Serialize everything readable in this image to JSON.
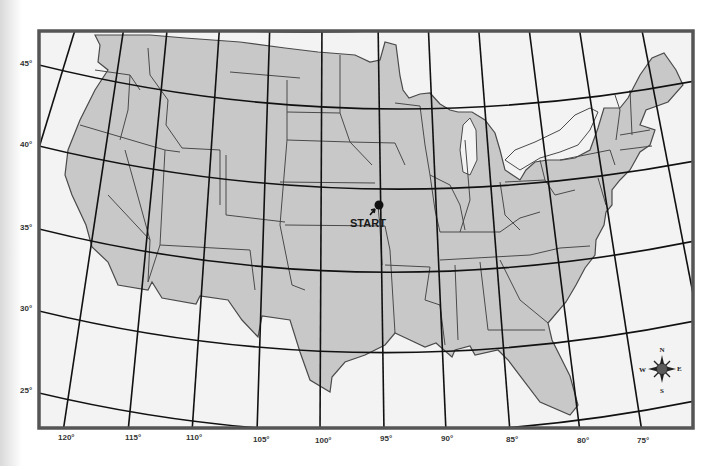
{
  "map": {
    "title": "",
    "colors": {
      "land": "#c8c8c8",
      "water": "#f3f3f3",
      "border": "#555555",
      "graticule": "#111111",
      "state_line": "#4a4a4a",
      "marker": "#111111",
      "compass": "#5a5a5a"
    },
    "latitude_labels": [
      {
        "label": "45°",
        "y": 63
      },
      {
        "label": "40°",
        "y": 144
      },
      {
        "label": "35°",
        "y": 227
      },
      {
        "label": "30°",
        "y": 308
      },
      {
        "label": "25°",
        "y": 390
      }
    ],
    "longitude_labels": [
      {
        "label": "120°",
        "x": 65
      },
      {
        "label": "115°",
        "x": 132
      },
      {
        "label": "110°",
        "x": 193
      },
      {
        "label": "105°",
        "x": 260
      },
      {
        "label": "100°",
        "x": 322
      },
      {
        "label": "95°",
        "x": 385
      },
      {
        "label": "90°",
        "x": 445
      },
      {
        "label": "85°",
        "x": 510
      },
      {
        "label": "80°",
        "x": 581
      },
      {
        "label": "75°",
        "x": 641
      }
    ],
    "marker": {
      "label": "START",
      "x": 379,
      "y": 205
    },
    "compass": {
      "n": "N",
      "s": "S",
      "e": "E",
      "w": "W"
    }
  }
}
